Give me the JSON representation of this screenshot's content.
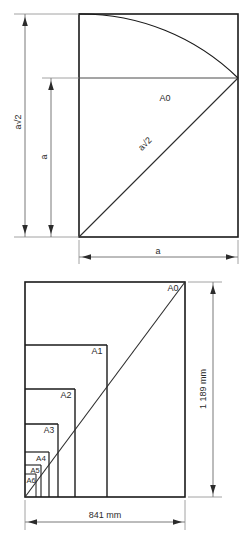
{
  "figure": {
    "line_color": "#1a1a1a",
    "text_color": "#2b2b2b"
  },
  "top_diagram": {
    "name": "a0-construction",
    "sheet_label": "A0",
    "diagonal_label": "a√2",
    "height_dimension_label": "a√2",
    "square_side_dimension_label": "a",
    "width_dimension_label": "a",
    "description": "Square of side a with its diagonal a√2 rotated by an arc to set the long side of A0"
  },
  "bottom_diagram": {
    "name": "a-series-subdivision",
    "sizes": [
      {
        "label": "A0"
      },
      {
        "label": "A1"
      },
      {
        "label": "A2"
      },
      {
        "label": "A3"
      },
      {
        "label": "A4"
      },
      {
        "label": "A5"
      },
      {
        "label": "A6"
      }
    ],
    "width_dimension_label": "841 mm",
    "height_dimension_label": "1 189 mm"
  }
}
